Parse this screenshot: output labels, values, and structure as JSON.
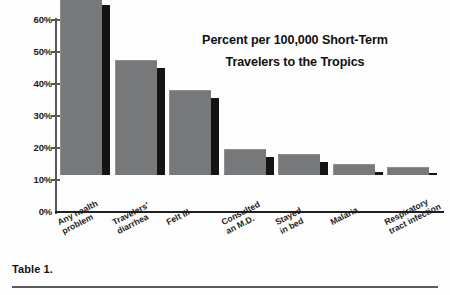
{
  "figure": {
    "caption": "Table 1.",
    "title_lines": [
      "Percent per 100,000 Short-Term",
      "Travelers to the Tropics"
    ],
    "bar_face_color": "#77787a",
    "bar_shadow_color": "#141414",
    "axis_color": "#58585a",
    "text_color": "#1b1b1b"
  },
  "chart_data": {
    "type": "bar",
    "xlabel": "",
    "ylabel": "",
    "ylim": [
      0,
      60
    ],
    "ytick_labels": [
      "60%",
      "50%",
      "40%",
      "30%",
      "20%",
      "10%",
      "0%"
    ],
    "ytick_values": [
      60,
      50,
      40,
      30,
      20,
      10,
      0
    ],
    "grid": false,
    "legend": "none",
    "style": "3d-shadowed vertical bars, grayscale",
    "categories": [
      "Any health problem",
      "Travelers' diarrhea",
      "Felt ill",
      "Consulted an M.D.",
      "Stayed in bed",
      "Malaria",
      "Respiratory tract infection"
    ],
    "category_label_lines": [
      [
        "Any health",
        "problem"
      ],
      [
        "Travelers'",
        "diarrhea"
      ],
      [
        "Felt ill"
      ],
      [
        "Consulted",
        "an M.D."
      ],
      [
        "Stayed",
        "in bed"
      ],
      [
        "Malaria"
      ],
      [
        "Respiratory",
        "tract infection"
      ]
    ],
    "values": [
      55.5,
      36,
      26.5,
      8,
      6.5,
      3.5,
      2.5
    ],
    "value_unit": "%"
  }
}
